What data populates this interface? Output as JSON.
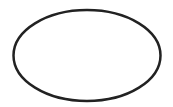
{
  "canvas": {
    "width": 173,
    "height": 107,
    "background": "#ffffff"
  },
  "shapes": [
    {
      "type": "ellipse",
      "cx": 87,
      "cy": 55.5,
      "rx": 73.5,
      "ry": 45.5,
      "fill": "none",
      "stroke": "#222222",
      "stroke_width": 2.5
    }
  ]
}
